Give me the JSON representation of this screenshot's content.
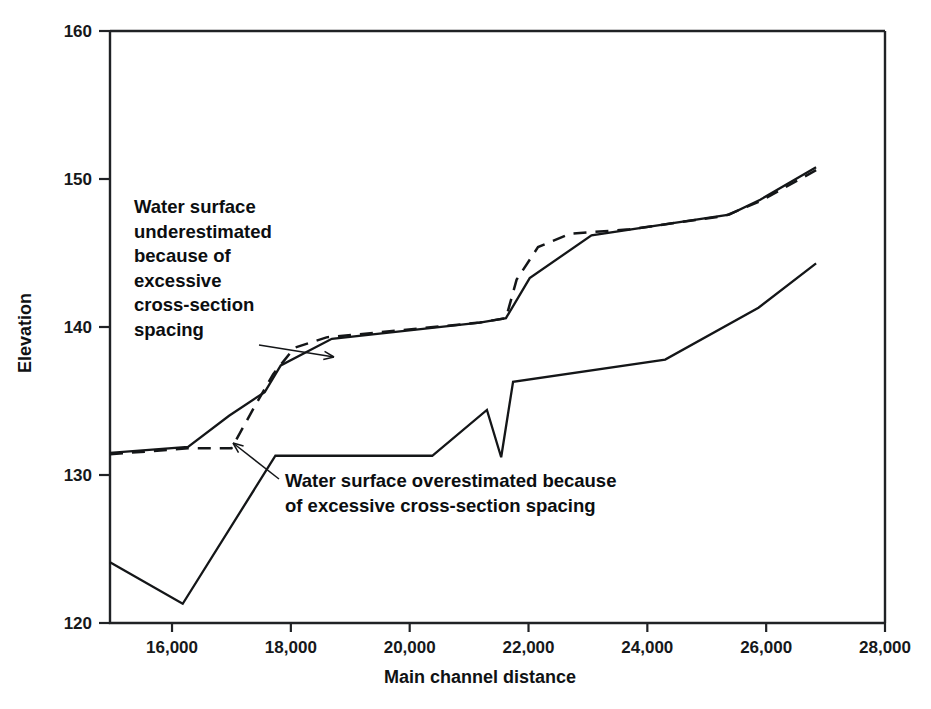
{
  "chart_data": {
    "type": "line",
    "title": "",
    "xlabel": "Main channel distance",
    "ylabel": "Elevation",
    "xlim": [
      14956,
      28000
    ],
    "ylim": [
      120,
      160
    ],
    "grid": false,
    "legend_position": "none",
    "xticks": [
      16000,
      18000,
      20000,
      22000,
      24000,
      26000,
      28000
    ],
    "xtick_labels": [
      "16,000",
      "18,000",
      "20,000",
      "22,000",
      "24,000",
      "26,000",
      "28,000"
    ],
    "yticks": [
      120,
      130,
      140,
      150,
      160
    ],
    "ytick_labels": [
      "120",
      "130",
      "140",
      "150",
      "160"
    ],
    "series": [
      {
        "name": "water-surface-solid-upper",
        "style": "solid",
        "points": [
          [
            14956,
            131.5
          ],
          [
            16270,
            131.9
          ],
          [
            16960,
            134.0
          ],
          [
            17560,
            135.6
          ],
          [
            17830,
            137.4
          ],
          [
            18690,
            139.2
          ],
          [
            21180,
            140.3
          ],
          [
            21620,
            140.6
          ],
          [
            22020,
            143.3
          ],
          [
            23060,
            146.2
          ],
          [
            25380,
            147.6
          ],
          [
            25900,
            148.6
          ],
          [
            26840,
            150.8
          ]
        ]
      },
      {
        "name": "water-surface-dashed",
        "style": "dashed",
        "points": [
          [
            14956,
            131.4
          ],
          [
            16270,
            131.8
          ],
          [
            17000,
            131.8
          ],
          [
            17400,
            134.7
          ],
          [
            17700,
            136.8
          ],
          [
            18060,
            138.6
          ],
          [
            18600,
            139.3
          ],
          [
            21180,
            140.3
          ],
          [
            21620,
            140.6
          ],
          [
            21800,
            143.2
          ],
          [
            22160,
            145.4
          ],
          [
            22700,
            146.3
          ],
          [
            23700,
            146.6
          ],
          [
            25300,
            147.5
          ],
          [
            25900,
            148.5
          ],
          [
            26840,
            150.6
          ]
        ]
      },
      {
        "name": "water-surface-solid-lower",
        "style": "solid",
        "points": [
          [
            14956,
            124.1
          ],
          [
            16180,
            121.3
          ],
          [
            17740,
            131.3
          ],
          [
            20380,
            131.3
          ],
          [
            21300,
            134.4
          ],
          [
            21540,
            131.2
          ],
          [
            21740,
            136.3
          ],
          [
            24300,
            137.8
          ],
          [
            25870,
            141.3
          ],
          [
            26840,
            144.3
          ]
        ]
      }
    ],
    "annotations": [
      {
        "name": "annotation-underestimated",
        "lines": [
          "Water surface",
          "underestimated",
          "because of",
          "excessive",
          "cross-section",
          "spacing"
        ],
        "x": 134,
        "y": 213,
        "line_height": 24.5,
        "leader": [
          [
            259,
            345
          ],
          [
            334,
            357
          ]
        ]
      },
      {
        "name": "annotation-overestimated",
        "lines": [
          "Water surface overestimated because",
          "of excessive cross-section spacing"
        ],
        "x": 285,
        "y": 487,
        "line_height": 25,
        "leader": [
          [
            279,
            479
          ],
          [
            233,
            443
          ]
        ]
      }
    ]
  },
  "axis_geometry": {
    "left_px": 110,
    "right_px": 885,
    "top_px": 31,
    "bottom_px": 623
  }
}
